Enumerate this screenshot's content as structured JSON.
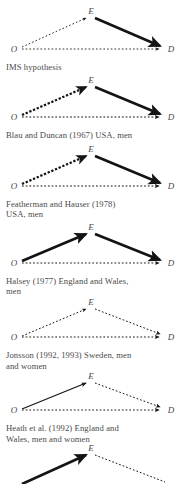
{
  "figure": {
    "background_color": "#ffffff",
    "text_color": "#4a4a4a",
    "line_color": "#1a1a1a",
    "node_labels": {
      "origin": "O",
      "education": "E",
      "destination": "D"
    }
  },
  "panels": [
    {
      "id": "ims-hypothesis",
      "caption": "IMS hypothesis",
      "edges": [
        {
          "from": "O",
          "to": "E",
          "style": "dotted",
          "weight": 0.9
        },
        {
          "from": "E",
          "to": "D",
          "style": "solid",
          "weight": 2.6
        },
        {
          "from": "O",
          "to": "D",
          "style": "dotted",
          "weight": 0.9
        }
      ]
    },
    {
      "id": "blau-duncan-1967",
      "caption": "Blau and Duncan (1967) USA, men",
      "edges": [
        {
          "from": "O",
          "to": "E",
          "style": "dashed",
          "weight": 2.2
        },
        {
          "from": "E",
          "to": "D",
          "style": "solid",
          "weight": 2.6
        },
        {
          "from": "O",
          "to": "D",
          "style": "dashed",
          "weight": 1.1
        }
      ]
    },
    {
      "id": "featherman-hauser-1978",
      "caption": "Featherman and Hauser (1978)\nUSA, men",
      "edges": [
        {
          "from": "O",
          "to": "E",
          "style": "dashed",
          "weight": 2.2
        },
        {
          "from": "E",
          "to": "D",
          "style": "solid",
          "weight": 2.6
        },
        {
          "from": "O",
          "to": "D",
          "style": "dashed",
          "weight": 1.1
        }
      ]
    },
    {
      "id": "halsey-1977",
      "caption": "Halsey (1977) England and Wales,\nmen",
      "edges": [
        {
          "from": "O",
          "to": "E",
          "style": "solid",
          "weight": 2.6
        },
        {
          "from": "E",
          "to": "D",
          "style": "solid",
          "weight": 2.6
        },
        {
          "from": "O",
          "to": "D",
          "style": "dotted",
          "weight": 1.0
        }
      ]
    },
    {
      "id": "jonsson-1992-1993",
      "caption": "Jonsson (1992, 1993) Sweden, men\nand women",
      "edges": [
        {
          "from": "O",
          "to": "E",
          "style": "dotted",
          "weight": 1.0
        },
        {
          "from": "E",
          "to": "D",
          "style": "dotted",
          "weight": 1.0
        },
        {
          "from": "O",
          "to": "D",
          "style": "dotted",
          "weight": 1.0
        }
      ]
    },
    {
      "id": "heath-et-al-1992",
      "caption": "Heath et al. (1992) England and\nWales, men and women",
      "caption_italic_part": "et al.",
      "edges": [
        {
          "from": "O",
          "to": "E",
          "style": "solid",
          "weight": 1.2
        },
        {
          "from": "E",
          "to": "D",
          "style": "dotted",
          "weight": 1.0
        },
        {
          "from": "O",
          "to": "D",
          "style": "dotted",
          "weight": 1.0
        }
      ]
    },
    {
      "id": "panel-seven-partial",
      "caption": "",
      "edges": [
        {
          "from": "O",
          "to": "E",
          "style": "solid",
          "weight": 2.6
        },
        {
          "from": "E",
          "to": "D",
          "style": "dotted",
          "weight": 1.0
        }
      ]
    }
  ]
}
